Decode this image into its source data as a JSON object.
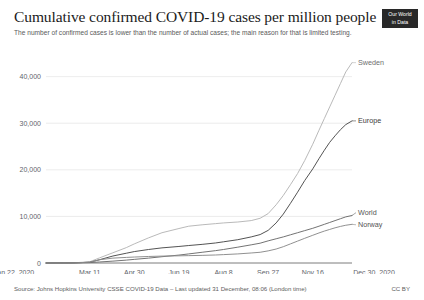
{
  "header": {
    "title": "Cumulative confirmed COVID-19 cases per million people",
    "subtitle": "The number of confirmed cases is lower than the number of actual cases; the main reason for that is limited testing.",
    "logo_line1": "Our World",
    "logo_line2": "in Data"
  },
  "footer": {
    "source": "Source: Johns Hopkins University CSSE COVID-19 Data – Last updated 31 December, 08:06 (London time)",
    "license": "CC BY"
  },
  "chart_data": {
    "type": "line",
    "title": "Cumulative confirmed COVID-19 cases per million people",
    "subtitle": "The number of confirmed cases is lower than the number of actual cases; the main reason for that is limited testing.",
    "xlabel": "",
    "ylabel": "",
    "ylim": [
      0,
      44000
    ],
    "yticks": [
      0,
      10000,
      20000,
      30000,
      40000
    ],
    "ytick_labels": [
      "0",
      "10,000",
      "20,000",
      "30,000",
      "40,000"
    ],
    "xticks": [
      0,
      49,
      99,
      149,
      199,
      249,
      299,
      343
    ],
    "xtick_labels": [
      "Jan 22, 2020",
      "Mar 11",
      "Apr 30",
      "Jun 19",
      "Aug 8",
      "Sep 27",
      "Nov 16",
      "Dec 30, 2020"
    ],
    "xlim": [
      0,
      343
    ],
    "grid": true,
    "legend_position": "right-inline",
    "series": [
      {
        "name": "Sweden",
        "color": "#b5b5b5",
        "label_color": "#6e6e6e",
        "x": [
          0,
          30,
          49,
          60,
          75,
          90,
          99,
          115,
          130,
          149,
          160,
          175,
          190,
          199,
          215,
          230,
          240,
          249,
          258,
          266,
          274,
          282,
          290,
          299,
          306,
          312,
          318,
          324,
          330,
          336,
          343
        ],
        "y": [
          0,
          30,
          260,
          1100,
          2200,
          3300,
          4100,
          5400,
          6500,
          7400,
          7900,
          8200,
          8450,
          8600,
          8800,
          9100,
          9600,
          10600,
          12500,
          14500,
          16800,
          19200,
          22000,
          25500,
          28500,
          31000,
          33500,
          36000,
          38500,
          41000,
          43000
        ]
      },
      {
        "name": "Europe",
        "color": "#4a4a4a",
        "label_color": "#3a3a3a",
        "x": [
          0,
          30,
          49,
          60,
          75,
          90,
          99,
          115,
          130,
          149,
          160,
          175,
          190,
          199,
          215,
          230,
          240,
          249,
          258,
          266,
          274,
          282,
          290,
          299,
          306,
          312,
          318,
          324,
          330,
          336,
          343
        ],
        "y": [
          0,
          20,
          160,
          700,
          1500,
          2100,
          2450,
          2900,
          3250,
          3550,
          3750,
          4000,
          4300,
          4550,
          5000,
          5600,
          6100,
          7000,
          8600,
          10500,
          12800,
          15200,
          17700,
          20200,
          22400,
          24200,
          25900,
          27300,
          28600,
          29700,
          30500
        ]
      },
      {
        "name": "World",
        "color": "#6b6b6b",
        "label_color": "#555555",
        "x": [
          0,
          30,
          49,
          60,
          75,
          90,
          99,
          115,
          130,
          149,
          160,
          175,
          190,
          199,
          215,
          230,
          240,
          249,
          258,
          266,
          274,
          282,
          290,
          299,
          306,
          312,
          318,
          324,
          330,
          336,
          343
        ],
        "y": [
          0,
          15,
          90,
          220,
          400,
          620,
          780,
          1050,
          1350,
          1700,
          1950,
          2300,
          2650,
          2900,
          3400,
          3900,
          4250,
          4750,
          5200,
          5600,
          6050,
          6500,
          6950,
          7450,
          7900,
          8300,
          8700,
          9100,
          9500,
          9900,
          10200
        ]
      },
      {
        "name": "Norway",
        "color": "#8a8a8a",
        "label_color": "#555555",
        "x": [
          0,
          30,
          49,
          60,
          75,
          90,
          99,
          115,
          130,
          149,
          160,
          175,
          190,
          199,
          215,
          230,
          240,
          249,
          258,
          266,
          274,
          282,
          290,
          299,
          306,
          312,
          318,
          324,
          330,
          336,
          343
        ],
        "y": [
          0,
          5,
          180,
          700,
          1050,
          1200,
          1280,
          1400,
          1480,
          1540,
          1580,
          1640,
          1720,
          1800,
          1950,
          2150,
          2300,
          2600,
          3000,
          3500,
          4100,
          4700,
          5300,
          5950,
          6450,
          6850,
          7200,
          7550,
          7850,
          8100,
          8300
        ]
      }
    ]
  }
}
